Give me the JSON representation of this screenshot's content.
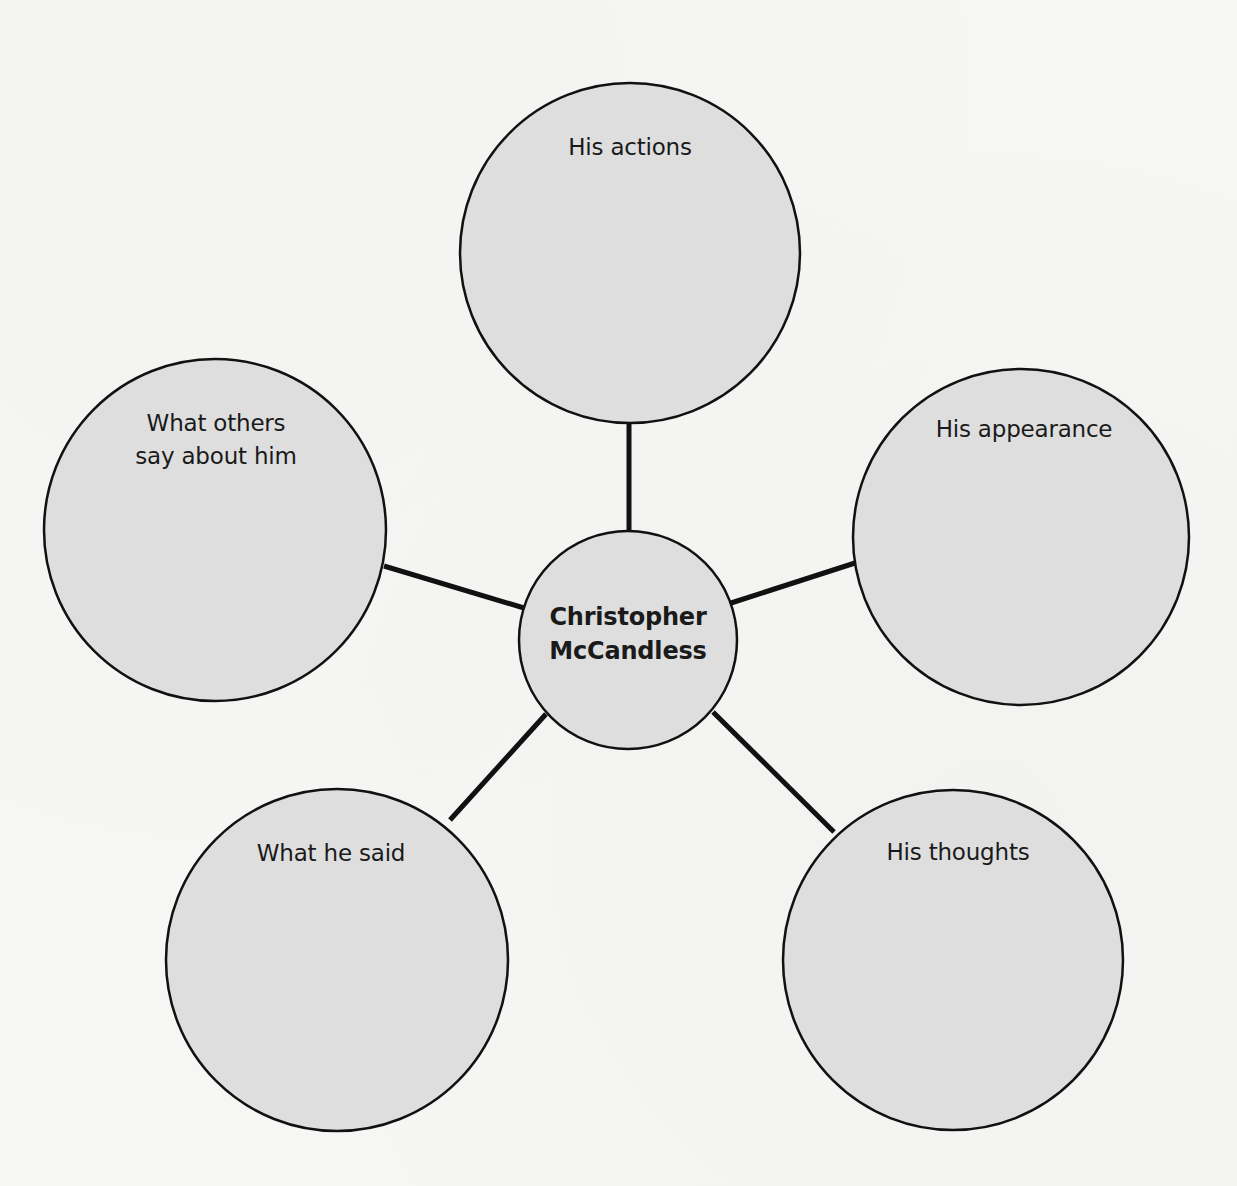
{
  "diagram": {
    "type": "concept-web",
    "colors": {
      "background": "#f6f6f4",
      "circle_fill": "#dedede",
      "stroke": "#111111",
      "text": "#1a1a1a"
    },
    "center": {
      "label_line1": "Christopher",
      "label_line2": "McCandless",
      "cx": 628,
      "cy": 640,
      "r": 109
    },
    "nodes": [
      {
        "id": "actions",
        "label_line1": "His actions",
        "label_line2": "",
        "cx": 630,
        "cy": 253,
        "r": 170
      },
      {
        "id": "appearance",
        "label_line1": "His appearance",
        "label_line2": "",
        "cx": 1021,
        "cy": 537,
        "r": 168
      },
      {
        "id": "thoughts",
        "label_line1": "His thoughts",
        "label_line2": "",
        "cx": 953,
        "cy": 960,
        "r": 170
      },
      {
        "id": "said",
        "label_line1": "What he said",
        "label_line2": "",
        "cx": 337,
        "cy": 960,
        "r": 171
      },
      {
        "id": "others",
        "label_line1": "What others",
        "label_line2": "say about him",
        "cx": 215,
        "cy": 530,
        "r": 171
      }
    ],
    "connectors": [
      {
        "to": "actions",
        "x1": 629,
        "y1": 424,
        "x2": 629,
        "y2": 530
      },
      {
        "to": "appearance",
        "x1": 731,
        "y1": 603,
        "x2": 855,
        "y2": 563
      },
      {
        "to": "thoughts",
        "x1": 713,
        "y1": 712,
        "x2": 834,
        "y2": 832
      },
      {
        "to": "said",
        "x1": 546,
        "y1": 714,
        "x2": 450,
        "y2": 820
      },
      {
        "to": "others",
        "x1": 384,
        "y1": 566,
        "x2": 524,
        "y2": 608
      }
    ]
  }
}
